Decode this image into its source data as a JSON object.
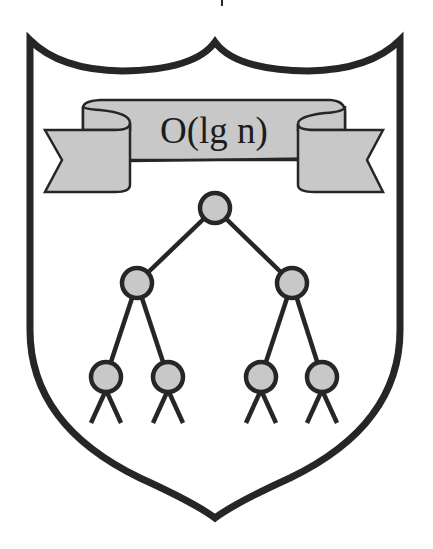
{
  "crest": {
    "banner_text": "O(lg n)",
    "colors": {
      "outline": "#262626",
      "fill": "#c8c8c8",
      "background": "#ffffff"
    }
  },
  "tree": {
    "levels": 3,
    "nodes": [
      {
        "id": "root",
        "x": 215,
        "y": 208
      },
      {
        "id": "l1-left",
        "x": 137,
        "y": 283
      },
      {
        "id": "l1-right",
        "x": 292,
        "y": 283
      },
      {
        "id": "leaf-1",
        "x": 106,
        "y": 377
      },
      {
        "id": "leaf-2",
        "x": 168,
        "y": 377
      },
      {
        "id": "leaf-3",
        "x": 261,
        "y": 377
      },
      {
        "id": "leaf-4",
        "x": 322,
        "y": 377
      }
    ]
  }
}
